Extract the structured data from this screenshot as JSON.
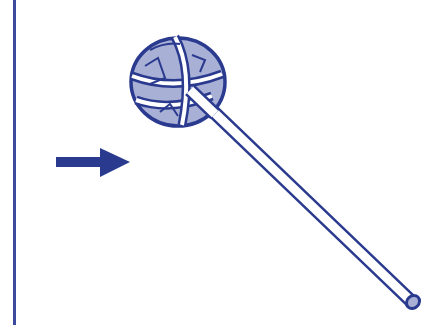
{
  "figure": {
    "colors": {
      "stroke": "#2a3a8f",
      "fill_light": "#a9b0d6",
      "background": "#ffffff",
      "divider": "#3b4a9c"
    },
    "elements": {
      "divider": "vertical-rule",
      "arrow": "arrow-right",
      "tool": "swab-brush"
    }
  }
}
